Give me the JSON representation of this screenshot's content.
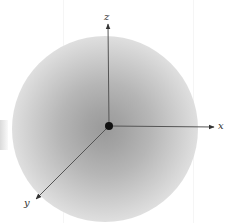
{
  "diagram": {
    "type": "3d-coordinate-axes",
    "origin": {
      "x": 109,
      "y": 126
    },
    "axes": [
      {
        "name": "x",
        "label": "x",
        "end": {
          "x": 214,
          "y": 127
        },
        "label_pos": {
          "x": 218,
          "y": 121
        }
      },
      {
        "name": "y",
        "label": "y",
        "end": {
          "x": 36,
          "y": 199
        },
        "label_pos": {
          "x": 24,
          "y": 198
        }
      },
      {
        "name": "z",
        "label": "z",
        "end": {
          "x": 108,
          "y": 24
        },
        "label_pos": {
          "x": 105,
          "y": 12
        }
      }
    ],
    "nucleus": {
      "radius": 4,
      "color": "#111111"
    },
    "cloud": {
      "center_color": "#9a9a9a",
      "edge_color": "#ffffff",
      "radius": 93
    },
    "axis_color": "#555555"
  }
}
